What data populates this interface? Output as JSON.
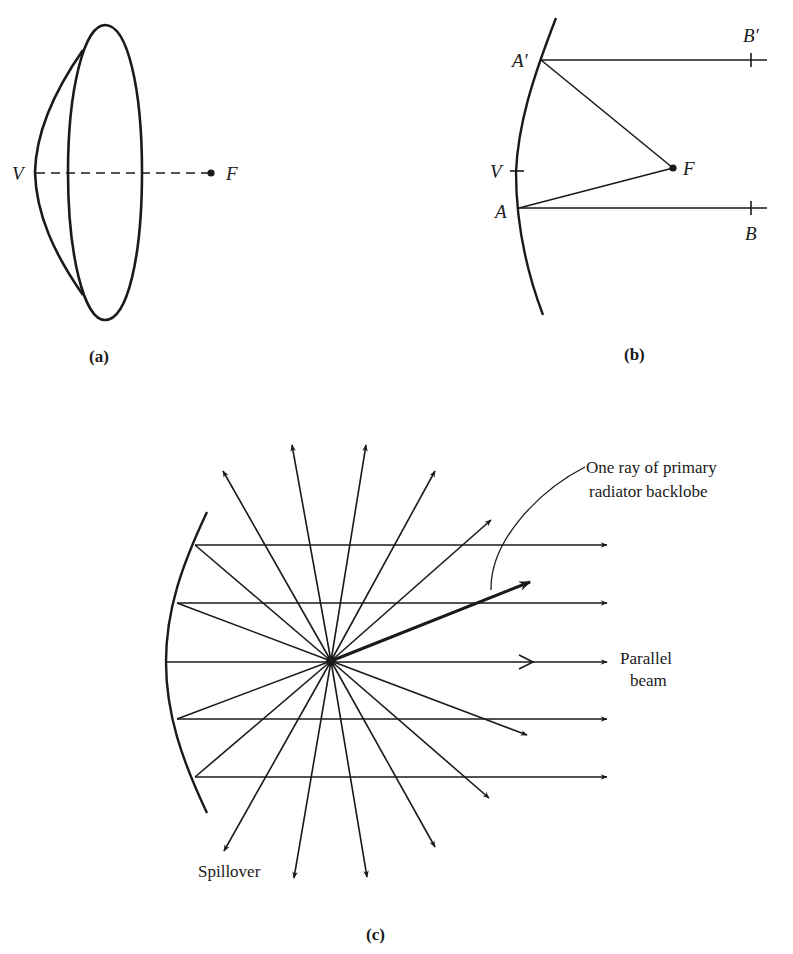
{
  "panel_a": {
    "caption": "(a)",
    "labels": {
      "vertex": "V",
      "focus": "F"
    }
  },
  "panel_b": {
    "caption": "(b)",
    "labels": {
      "a_prime": "A′",
      "b_prime": "B′",
      "vertex": "V",
      "focus": "F",
      "a": "A",
      "b": "B"
    }
  },
  "panel_c": {
    "caption": "(c)",
    "annotations": {
      "backlobe_line1": "One ray of primary",
      "backlobe_line2": "radiator backlobe",
      "beam_line1": "Parallel",
      "beam_line2": "beam",
      "spillover": "Spillover"
    }
  },
  "colors": {
    "ink": "#1a1a1a",
    "background": "#ffffff"
  }
}
